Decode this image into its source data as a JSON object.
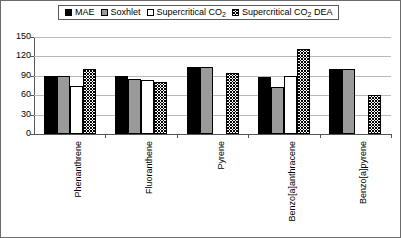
{
  "legend": {
    "entries": [
      {
        "label": "MAE",
        "pattern": "solid"
      },
      {
        "label": "Soxhlet",
        "pattern": "gray"
      },
      {
        "label": "Supercritical CO2",
        "pattern": "white"
      },
      {
        "label": "Supercritical CO2 DEA",
        "pattern": "hatch"
      }
    ]
  },
  "yaxis": {
    "ticks": [
      "0",
      "30",
      "60",
      "90",
      "120",
      "150"
    ]
  },
  "chart_data": {
    "type": "bar",
    "title": "",
    "xlabel": "",
    "ylabel": "",
    "ylim": [
      0,
      150
    ],
    "ytick_step": 30,
    "grid": true,
    "legend_position": "top",
    "categories": [
      "Phenanthrene",
      "Fluoranthene",
      "Pyrene",
      "Benzo[a]anthracene",
      "Benzo[a]pyrene"
    ],
    "series": [
      {
        "name": "MAE",
        "pattern": "solid",
        "values": [
          90,
          90,
          103,
          88,
          100
        ]
      },
      {
        "name": "Soxhlet",
        "pattern": "gray",
        "values": [
          90,
          85,
          103,
          72,
          100
        ]
      },
      {
        "name": "Supercritical CO2",
        "pattern": "white",
        "values": [
          75,
          83,
          0,
          90,
          0
        ]
      },
      {
        "name": "Supercritical CO2 DEA",
        "pattern": "hatch",
        "values": [
          100,
          80,
          95,
          132,
          60
        ]
      }
    ]
  }
}
